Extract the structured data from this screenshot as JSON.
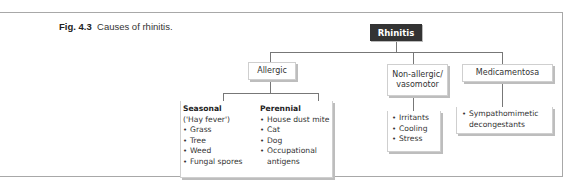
{
  "caption": {
    "label": "Fig. 4.3",
    "text": "Causes of rhinitis."
  },
  "diagram": {
    "root": "Rhinitis",
    "categories": [
      {
        "label": "Allergic",
        "groups": [
          {
            "heading": "Seasonal",
            "subheading": "('Hay fever')",
            "items": [
              "Grass",
              "Tree",
              "Weed",
              "Fungal spores"
            ]
          },
          {
            "heading": "Perennial",
            "items": [
              "House dust mite",
              "Cat",
              "Dog",
              "Occupational",
              "antigens"
            ]
          }
        ]
      },
      {
        "label_line1": "Non-allergic/",
        "label_line2": "vasomotor",
        "items": [
          "Irritants",
          "Cooling",
          "Stress"
        ]
      },
      {
        "label": "Medicamentosa",
        "items": [
          "Sympathomimetic",
          "decongestants"
        ]
      }
    ]
  },
  "colors": {
    "root_fill": "#333333",
    "box_border": "#cfcfcf",
    "connector": "#777777",
    "frame": "#a8a8a8"
  }
}
